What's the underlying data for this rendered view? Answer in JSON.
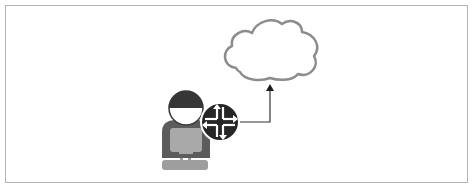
{
  "diagram": {
    "type": "network-topology",
    "nodes": [
      {
        "id": "user",
        "icon": "person-at-computer-icon",
        "label": ""
      },
      {
        "id": "router",
        "icon": "router-icon",
        "label": ""
      },
      {
        "id": "cloud",
        "icon": "cloud-icon",
        "label": ""
      }
    ],
    "edges": [
      {
        "from": "router",
        "to": "cloud",
        "arrow": "end"
      }
    ],
    "colors": {
      "frame": "#b4b4b4",
      "cloud_stroke": "#8c8c8c",
      "person_head": "#3a3a3a",
      "person_body": "#5a5a5a",
      "person_screen": "#a8a8a8",
      "router_fill": "#2a2a2a",
      "connector": "#2a2a2a"
    }
  }
}
